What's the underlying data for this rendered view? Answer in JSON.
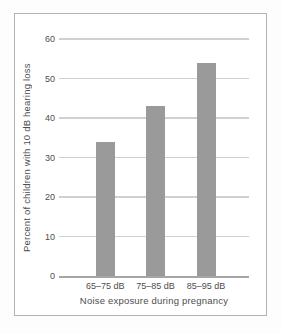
{
  "figure": {
    "background": "#ffffff",
    "frame_border_color": "#b2b2b2"
  },
  "chart_data": {
    "type": "bar",
    "categories": [
      "65–75 dB",
      "75–85 dB",
      "85–95 dB"
    ],
    "values": [
      34,
      43,
      54
    ],
    "title": "",
    "xlabel": "Noise exposure during pregnancy",
    "ylabel": "Percent of children with 10 dB hearing loss",
    "ylim": [
      0,
      60
    ],
    "yticks": [
      0,
      10,
      20,
      30,
      40,
      50,
      60
    ],
    "grid": true,
    "legend": "none",
    "bar_color": "#9a9a9a",
    "gridline_color": "#d0d0d0",
    "axis_line_color": "#a6a6a6",
    "text_color": "#4d4d4d",
    "bar_width_px": 19,
    "bar_centers_frac": [
      0.243,
      0.508,
      0.774
    ]
  }
}
